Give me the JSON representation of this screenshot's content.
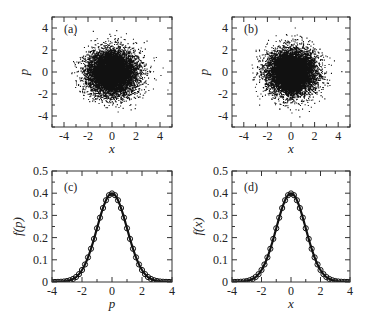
{
  "figure": {
    "width": 375,
    "height": 324,
    "ink_color": "#111111",
    "frame_color": "#333333"
  },
  "chart_data": [
    {
      "id": "a",
      "type": "scatter",
      "panel_label": "(a)",
      "xlabel": "x",
      "ylabel": "p",
      "xlim": [
        -5,
        5
      ],
      "ylim": [
        -5,
        5
      ],
      "xticks": [
        -4,
        -2,
        0,
        2,
        4
      ],
      "yticks": [
        -4,
        -2,
        0,
        2,
        4
      ],
      "minor_step": 1,
      "frame": [
        52,
        17,
        172,
        127
      ],
      "points": {
        "count": 9000,
        "distribution": "gaussian",
        "mean": [
          0,
          0
        ],
        "std": [
          1,
          1
        ],
        "seed": 11
      },
      "description": "Dense 2D Gaussian cloud of phase-space points centered at (0,0), spread roughly -3.5..3.5"
    },
    {
      "id": "b",
      "type": "scatter",
      "panel_label": "(b)",
      "xlabel": "x",
      "ylabel": "p",
      "xlim": [
        -5,
        5
      ],
      "ylim": [
        -5,
        5
      ],
      "xticks": [
        -4,
        -2,
        0,
        2,
        4
      ],
      "yticks": [
        -4,
        -2,
        0,
        2,
        4
      ],
      "minor_step": 1,
      "frame": [
        232,
        17,
        350,
        127
      ],
      "points": {
        "count": 9000,
        "distribution": "gaussian",
        "mean": [
          0,
          0
        ],
        "std": [
          1,
          1
        ],
        "seed": 29
      },
      "description": "Dense 2D Gaussian cloud of phase-space points centered at (0,0), spread roughly -3.5..3.5"
    },
    {
      "id": "c",
      "type": "line",
      "panel_label": "(c)",
      "xlabel": "p",
      "ylabel": "f(p)",
      "xlim": [
        -4,
        4
      ],
      "ylim": [
        0,
        0.5
      ],
      "xticks": [
        -4,
        -2,
        0,
        2,
        4
      ],
      "yticks": [
        0,
        0.1,
        0.2,
        0.3,
        0.4,
        0.5
      ],
      "ytick_labels": [
        "0",
        "0.1",
        "0.2",
        "0.3",
        "0.4",
        "0.5"
      ],
      "frame": [
        52,
        171,
        172,
        282
      ],
      "series": [
        {
          "name": "theory",
          "style": "solid-line",
          "function": "gaussian",
          "mean": 0,
          "std": 1
        },
        {
          "name": "simulation",
          "style": "open-circles",
          "function": "gaussian",
          "mean": 0,
          "std": 1,
          "x_start": -4,
          "x_end": 4,
          "x_step": 0.2
        }
      ],
      "peak": {
        "x": 0,
        "y": 0.399
      }
    },
    {
      "id": "d",
      "type": "line",
      "panel_label": "(d)",
      "xlabel": "x",
      "ylabel": "f(x)",
      "xlim": [
        -4,
        4
      ],
      "ylim": [
        0,
        0.5
      ],
      "xticks": [
        -4,
        -2,
        0,
        2,
        4
      ],
      "yticks": [
        0,
        0.1,
        0.2,
        0.3,
        0.4,
        0.5
      ],
      "ytick_labels": [
        "0",
        "0.1",
        "0.2",
        "0.3",
        "0.4",
        "0.5"
      ],
      "frame": [
        232,
        171,
        350,
        282
      ],
      "series": [
        {
          "name": "theory",
          "style": "solid-line",
          "function": "gaussian",
          "mean": 0,
          "std": 1
        },
        {
          "name": "simulation",
          "style": "open-circles",
          "function": "gaussian",
          "mean": 0,
          "std": 1,
          "x_start": -4,
          "x_end": 4,
          "x_step": 0.2
        }
      ],
      "peak": {
        "x": 0,
        "y": 0.399
      }
    }
  ]
}
